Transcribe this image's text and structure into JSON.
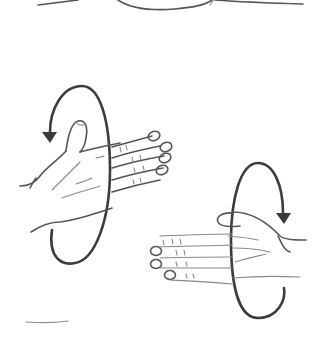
{
  "illustration": {
    "description": "Hand-drawn sketch: two hands with circular rotation arrows indicating forearm rotation (supination/pronation)",
    "colors": {
      "background": "#ffffff",
      "ink": "#555555",
      "arrow": "#3a3a3a"
    },
    "figures": [
      {
        "name": "top-partial-curve",
        "position": "top"
      },
      {
        "name": "left-hand-rotation",
        "arrow_direction": "counterclockwise-down-left"
      },
      {
        "name": "right-hand-rotation",
        "arrow_direction": "clockwise-down-right"
      }
    ]
  }
}
